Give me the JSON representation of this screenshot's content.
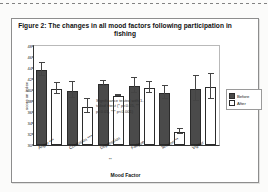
{
  "figure": {
    "title": "Figure 2: The changes in all mood factors following participation in fishing",
    "annotation_line1": "Significance tested with 1-",
    "annotation_line2": "tailed t test (* p<0.05, **",
    "annotation_line3": "p<0.01, *** p<0.001)"
  },
  "legend": {
    "position": "right",
    "before_label": "Before",
    "after_label": "After",
    "before_color": "#4a4a4a",
    "after_color": "#ffffff"
  },
  "chart_data": {
    "type": "bar",
    "title": "Figure 2: The changes in all mood factors following participation in fishing",
    "xlabel": "Mood Factor",
    "ylabel": "score on index",
    "ylim": [
      30,
      48
    ],
    "ytick_labels": [
      "48",
      "46",
      "44",
      "42",
      "40",
      "38",
      "36",
      "34",
      "32",
      "30"
    ],
    "ytick_values": [
      48,
      46,
      44,
      42,
      40,
      38,
      36,
      34,
      32,
      30
    ],
    "grid": false,
    "categories": [
      "Anger",
      "Confusion",
      "Depression",
      "Fatigue",
      "Tension",
      "Vigour"
    ],
    "category_significance": [
      "***",
      "***",
      "**",
      "",
      "**",
      ""
    ],
    "series": [
      {
        "name": "Before",
        "values": [
          43.7,
          39.9,
          41.1,
          40.7,
          39.4,
          40.2
        ],
        "errors": [
          1.3,
          1.5,
          0.5,
          1.4,
          1.3,
          2.4
        ]
      },
      {
        "name": "After",
        "values": [
          40.2,
          37.0,
          38.9,
          40.3,
          32.4,
          40.6
        ],
        "errors": [
          1.1,
          1.3,
          0.2,
          1.1,
          0.5,
          2.4
        ]
      }
    ]
  }
}
